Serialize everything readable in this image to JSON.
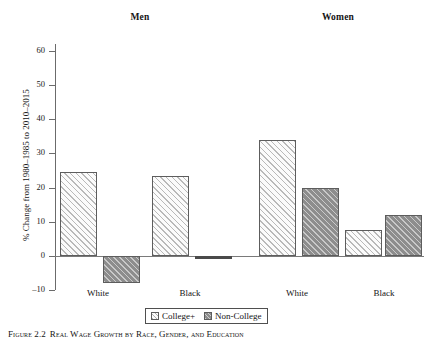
{
  "figure": {
    "caption_label": "Figure 2.2",
    "caption_title": "Real Wage Growth by Race, Gender, and Education"
  },
  "panels": {
    "men_title": "Men",
    "women_title": "Women"
  },
  "legend": {
    "college_label": "College+",
    "noncollege_label": "Non-College"
  },
  "chart_data": {
    "type": "bar",
    "title": "Real Wage Growth by Race, Gender, and Education",
    "xlabel": "",
    "ylabel": "% Change from 1980–1985 to 2010–2015",
    "ylim": [
      -10,
      60
    ],
    "yticks": [
      -10,
      0,
      10,
      20,
      30,
      40,
      50,
      60
    ],
    "ytick_labels": [
      "–10",
      "0",
      "10",
      "20",
      "30",
      "40",
      "50",
      "60"
    ],
    "grid": false,
    "legend_position": "bottom-center",
    "groups": [
      "Men",
      "Women"
    ],
    "categories": [
      "White",
      "Black",
      "White",
      "Black"
    ],
    "category_groups": [
      "Men",
      "Men",
      "Women",
      "Women"
    ],
    "series": [
      {
        "name": "College+",
        "values": [
          24.5,
          23.5,
          34.0,
          7.5
        ]
      },
      {
        "name": "Non-College",
        "values": [
          -8.0,
          0.0,
          20.0,
          12.0
        ]
      }
    ],
    "bars": [
      {
        "group": "Men",
        "race": "White",
        "education": "College+",
        "value": 24.5
      },
      {
        "group": "Men",
        "race": "White",
        "education": "Non-College",
        "value": -8.0
      },
      {
        "group": "Men",
        "race": "Black",
        "education": "College+",
        "value": 23.5
      },
      {
        "group": "Men",
        "race": "Black",
        "education": "Non-College",
        "value": 0.0
      },
      {
        "group": "Women",
        "race": "White",
        "education": "College+",
        "value": 34.0
      },
      {
        "group": "Women",
        "race": "White",
        "education": "Non-College",
        "value": 20.0
      },
      {
        "group": "Women",
        "race": "Black",
        "education": "College+",
        "value": 7.5
      },
      {
        "group": "Women",
        "race": "Black",
        "education": "Non-College",
        "value": 12.0
      }
    ]
  },
  "colors": {
    "college_fill": "#fbfbfb",
    "noncollege_fill": "#8d8d8d",
    "bar_border": "#5d5d5d",
    "axis": "#6b6b6b",
    "text": "#141414"
  }
}
